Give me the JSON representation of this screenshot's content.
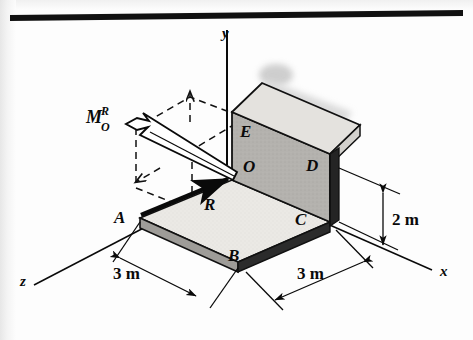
{
  "figure": {
    "kind": "statics-free-body-diagram",
    "top_rule": true,
    "axes": [
      {
        "id": "y",
        "label": "y"
      },
      {
        "id": "x",
        "label": "x"
      },
      {
        "id": "z",
        "label": "z"
      }
    ],
    "points": [
      {
        "id": "A",
        "label": "A"
      },
      {
        "id": "B",
        "label": "B"
      },
      {
        "id": "C",
        "label": "C"
      },
      {
        "id": "D",
        "label": "D"
      },
      {
        "id": "E",
        "label": "E"
      },
      {
        "id": "O",
        "label": "O"
      }
    ],
    "vectors": [
      {
        "id": "R",
        "label": "R",
        "kind": "resultant-force"
      },
      {
        "id": "MOR",
        "base": "M",
        "superscript": "R",
        "subscript": "O",
        "kind": "resultant-moment"
      }
    ],
    "dimensions": [
      {
        "id": "dim-left",
        "label": "3 m",
        "orientation": "z-direction"
      },
      {
        "id": "dim-right",
        "label": "3 m",
        "orientation": "x-direction"
      },
      {
        "id": "dim-height",
        "label": "2 m",
        "orientation": "y-direction"
      }
    ],
    "colors": {
      "ink": "#0a0a0a",
      "plate_top": "#eceae6",
      "plate_edge": "#9e9c98",
      "plate_edge_dark": "#2a2a2a",
      "wall_face": "#b3b1ad",
      "wall_top": "#e2e0dc",
      "background": "#fdfdfd",
      "shadow": "#bdbdbd"
    }
  }
}
